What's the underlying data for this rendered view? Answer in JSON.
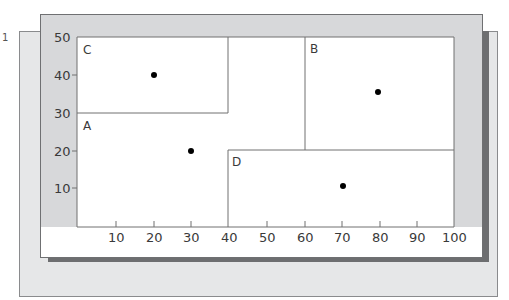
{
  "diagram": {
    "type": "kd-tree-partition",
    "corner_mark": "1",
    "x_axis": {
      "ticks": [
        "10",
        "20",
        "30",
        "40",
        "50",
        "60",
        "70",
        "80",
        "90",
        "100"
      ],
      "range": [
        0,
        100
      ]
    },
    "y_axis": {
      "ticks": [
        "10",
        "20",
        "30",
        "40",
        "50"
      ],
      "range": [
        0,
        50
      ]
    },
    "regions": [
      {
        "label": "A",
        "description": "L-shaped remainder region",
        "label_pos": [
          2,
          27
        ]
      },
      {
        "label": "B",
        "x": [
          60,
          100
        ],
        "y": [
          20,
          50
        ]
      },
      {
        "label": "C",
        "x": [
          0,
          40
        ],
        "y": [
          30,
          50
        ]
      },
      {
        "label": "D",
        "x": [
          40,
          100
        ],
        "y": [
          0,
          20
        ]
      }
    ],
    "points": [
      {
        "region": "C",
        "x": 20,
        "y": 40
      },
      {
        "region": "A",
        "x": 30,
        "y": 20
      },
      {
        "region": "B",
        "x": 80,
        "y": 35
      },
      {
        "region": "D",
        "x": 70,
        "y": 10
      }
    ],
    "colors": {
      "frame": "#d7d8da",
      "back_panel": "#e6e7e8",
      "shadow": "#6d6e70",
      "lines": "#707070",
      "points": "#000000"
    }
  }
}
